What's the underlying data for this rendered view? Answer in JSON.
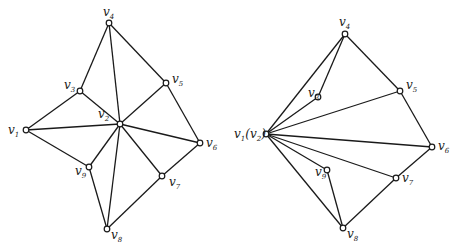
{
  "graphs": [
    {
      "name": "original-graph",
      "vertices": [
        {
          "id": "v1",
          "base": "v",
          "sub": "1",
          "suffix": ""
        },
        {
          "id": "v2",
          "base": "v",
          "sub": "2",
          "suffix": ""
        },
        {
          "id": "v3",
          "base": "v",
          "sub": "3",
          "suffix": ""
        },
        {
          "id": "v4",
          "base": "v",
          "sub": "4",
          "suffix": ""
        },
        {
          "id": "v5",
          "base": "v",
          "sub": "5",
          "suffix": ""
        },
        {
          "id": "v6",
          "base": "v",
          "sub": "6",
          "suffix": ""
        },
        {
          "id": "v7",
          "base": "v",
          "sub": "7",
          "suffix": ""
        },
        {
          "id": "v8",
          "base": "v",
          "sub": "8",
          "suffix": ""
        },
        {
          "id": "v9",
          "base": "v",
          "sub": "9",
          "suffix": ""
        }
      ],
      "edges": [
        [
          "v1",
          "v3"
        ],
        [
          "v1",
          "v2"
        ],
        [
          "v1",
          "v9"
        ],
        [
          "v3",
          "v4"
        ],
        [
          "v3",
          "v2"
        ],
        [
          "v4",
          "v2"
        ],
        [
          "v4",
          "v5"
        ],
        [
          "v5",
          "v2"
        ],
        [
          "v5",
          "v6"
        ],
        [
          "v6",
          "v2"
        ],
        [
          "v6",
          "v7"
        ],
        [
          "v7",
          "v2"
        ],
        [
          "v7",
          "v8"
        ],
        [
          "v8",
          "v2"
        ],
        [
          "v8",
          "v9"
        ],
        [
          "v9",
          "v2"
        ]
      ]
    },
    {
      "name": "contracted-graph",
      "vertices": [
        {
          "id": "v12",
          "base": "v",
          "sub": "1",
          "suffix": "(v2)"
        },
        {
          "id": "v3",
          "base": "v",
          "sub": "3",
          "suffix": ""
        },
        {
          "id": "v4",
          "base": "v",
          "sub": "4",
          "suffix": ""
        },
        {
          "id": "v5",
          "base": "v",
          "sub": "5",
          "suffix": ""
        },
        {
          "id": "v6",
          "base": "v",
          "sub": "6",
          "suffix": ""
        },
        {
          "id": "v7",
          "base": "v",
          "sub": "7",
          "suffix": ""
        },
        {
          "id": "v8",
          "base": "v",
          "sub": "8",
          "suffix": ""
        },
        {
          "id": "v9",
          "base": "v",
          "sub": "9",
          "suffix": ""
        }
      ],
      "edges": [
        [
          "v12",
          "v4"
        ],
        [
          "v12",
          "v3"
        ],
        [
          "v3",
          "v4"
        ],
        [
          "v4",
          "v5"
        ],
        [
          "v12",
          "v5"
        ],
        [
          "v12",
          "v6"
        ],
        [
          "v5",
          "v6"
        ],
        [
          "v6",
          "v7"
        ],
        [
          "v12",
          "v7"
        ],
        [
          "v7",
          "v8"
        ],
        [
          "v12",
          "v8"
        ],
        [
          "v12",
          "v9"
        ],
        [
          "v9",
          "v8"
        ]
      ]
    }
  ]
}
